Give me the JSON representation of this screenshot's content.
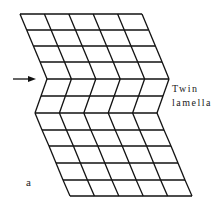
{
  "figure": {
    "panel_label": "a",
    "annotation": {
      "line1": "Twin",
      "line2": "lamella"
    },
    "arrow": {
      "points_to": "twin boundary"
    },
    "grid": {
      "columns": 5,
      "upper_rows": 4,
      "twin_rows": 2,
      "lower_rows": 5,
      "stroke_color": "#111111"
    }
  }
}
